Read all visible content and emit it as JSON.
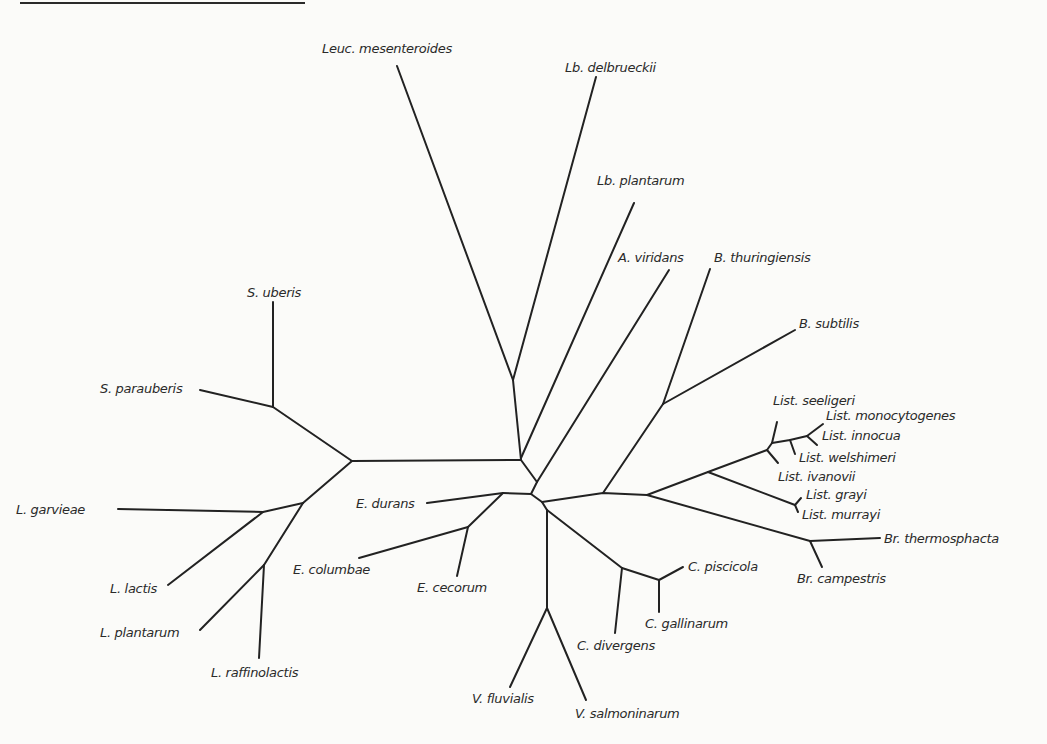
{
  "figure": {
    "type": "unrooted phylogenetic tree",
    "line_color": "#222222",
    "text_color": "#2a2a2a",
    "background": "#fbfbf9"
  },
  "taxa": [
    {
      "id": "leuc_mesenteroides",
      "label": "Leuc. mesenteroides",
      "x": 322,
      "y": 53,
      "anchor": "start"
    },
    {
      "id": "lb_delbrueckii",
      "label": "Lb. delbrueckii",
      "x": 565,
      "y": 72,
      "anchor": "start"
    },
    {
      "id": "lb_plantarum",
      "label": "Lb. plantarum",
      "x": 597,
      "y": 185,
      "anchor": "start"
    },
    {
      "id": "a_viridans",
      "label": "A. viridans",
      "x": 618,
      "y": 262,
      "anchor": "start"
    },
    {
      "id": "b_thuringiensis",
      "label": "B. thuringiensis",
      "x": 714,
      "y": 262,
      "anchor": "start"
    },
    {
      "id": "b_subtilis",
      "label": "B. subtilis",
      "x": 799,
      "y": 328,
      "anchor": "start"
    },
    {
      "id": "s_uberis",
      "label": "S. uberis",
      "x": 247,
      "y": 297,
      "anchor": "start"
    },
    {
      "id": "s_parauberis",
      "label": "S. parauberis",
      "x": 100,
      "y": 393,
      "anchor": "start"
    },
    {
      "id": "list_seeligeri",
      "label": "List. seeligeri",
      "x": 773,
      "y": 405,
      "anchor": "start"
    },
    {
      "id": "list_monocytogenes",
      "label": "List. monocytogenes",
      "x": 826,
      "y": 420,
      "anchor": "start"
    },
    {
      "id": "list_innocua",
      "label": "List. innocua",
      "x": 822,
      "y": 440,
      "anchor": "start"
    },
    {
      "id": "list_welshimeri",
      "label": "List. welshimeri",
      "x": 799,
      "y": 462,
      "anchor": "start"
    },
    {
      "id": "list_ivanovii",
      "label": "List. ivanovii",
      "x": 778,
      "y": 481,
      "anchor": "start"
    },
    {
      "id": "list_grayi",
      "label": "List. grayi",
      "x": 806,
      "y": 499,
      "anchor": "start"
    },
    {
      "id": "list_murrayi",
      "label": "List. murrayi",
      "x": 802,
      "y": 519,
      "anchor": "start"
    },
    {
      "id": "l_garvieae",
      "label": "L. garvieae",
      "x": 16,
      "y": 514,
      "anchor": "start"
    },
    {
      "id": "e_durans",
      "label": "E. durans",
      "x": 356,
      "y": 508,
      "anchor": "start"
    },
    {
      "id": "br_thermosphacta",
      "label": "Br. thermosphacta",
      "x": 884,
      "y": 543,
      "anchor": "start"
    },
    {
      "id": "l_lactis",
      "label": "L. lactis",
      "x": 110,
      "y": 593,
      "anchor": "start"
    },
    {
      "id": "e_columbae",
      "label": "E. columbae",
      "x": 293,
      "y": 574,
      "anchor": "start"
    },
    {
      "id": "e_cecorum",
      "label": "E. cecorum",
      "x": 417,
      "y": 592,
      "anchor": "start"
    },
    {
      "id": "c_piscicola",
      "label": "C. piscicola",
      "x": 688,
      "y": 571,
      "anchor": "start"
    },
    {
      "id": "br_campestris",
      "label": "Br. campestris",
      "x": 797,
      "y": 583,
      "anchor": "start"
    },
    {
      "id": "l_plantarum",
      "label": "L. plantarum",
      "x": 100,
      "y": 637,
      "anchor": "start"
    },
    {
      "id": "c_gallinarum",
      "label": "C. gallinarum",
      "x": 645,
      "y": 628,
      "anchor": "start"
    },
    {
      "id": "c_divergens",
      "label": "C. divergens",
      "x": 577,
      "y": 650,
      "anchor": "start"
    },
    {
      "id": "l_raffinolactis",
      "label": "L. raffinolactis",
      "x": 211,
      "y": 677,
      "anchor": "start"
    },
    {
      "id": "v_fluvialis",
      "label": "V. fluvialis",
      "x": 472,
      "y": 703,
      "anchor": "start"
    },
    {
      "id": "v_salmoninarum",
      "label": "V. salmoninarum",
      "x": 575,
      "y": 718,
      "anchor": "start"
    }
  ],
  "branches": [
    {
      "id": "leuc",
      "points": "397,66 513,380"
    },
    {
      "id": "lb_delb",
      "points": "596,77 513,380"
    },
    {
      "id": "upper_trunk",
      "points": "513,380 521,460 537,482 531,494"
    },
    {
      "id": "strep_lacto_trunk",
      "points": "521,460 352,461"
    },
    {
      "id": "lb_plant",
      "points": "634,203 521,458"
    },
    {
      "id": "a_viridans",
      "points": "669,270 537,482"
    },
    {
      "id": "strep_node",
      "points": "352,461 273,407"
    },
    {
      "id": "s_uberis",
      "points": "273,302 273,407"
    },
    {
      "id": "s_parauberis",
      "points": "200,390 273,407"
    },
    {
      "id": "lacto_node",
      "points": "352,461 303,503"
    },
    {
      "id": "l_garvieae",
      "points": "118,509 263,512 303,503"
    },
    {
      "id": "l_lactis",
      "points": "263,512 168,585"
    },
    {
      "id": "l_sub",
      "points": "303,503 264,565"
    },
    {
      "id": "l_plantarum",
      "points": "264,565 200,630"
    },
    {
      "id": "l_raffinolactis",
      "points": "264,565 259,658"
    },
    {
      "id": "entero_stem",
      "points": "531,494 503,493"
    },
    {
      "id": "e_durans",
      "points": "503,493 427,503"
    },
    {
      "id": "e_sub",
      "points": "503,493 468,527"
    },
    {
      "id": "e_columbae",
      "points": "468,527 359,558"
    },
    {
      "id": "e_cecorum",
      "points": "468,527 457,576"
    },
    {
      "id": "center_down",
      "points": "531,494 542,502 547,510"
    },
    {
      "id": "v_stem",
      "points": "547,510 547,608"
    },
    {
      "id": "v_fluvialis",
      "points": "547,608 510,687"
    },
    {
      "id": "v_salmoninarum",
      "points": "547,608 586,700"
    },
    {
      "id": "c_stem",
      "points": "547,510 622,568 659,580"
    },
    {
      "id": "c_divergens",
      "points": "622,568 615,633"
    },
    {
      "id": "c_piscicola",
      "points": "659,580 683,567"
    },
    {
      "id": "c_gallinarum",
      "points": "659,580 659,612"
    },
    {
      "id": "right_trunk",
      "points": "542,502 603,493 647,495"
    },
    {
      "id": "bacillus_stem",
      "points": "603,493 663,404"
    },
    {
      "id": "b_thuringiensis",
      "points": "663,404 710,269"
    },
    {
      "id": "b_subtilis",
      "points": "663,404 795,330"
    },
    {
      "id": "list_stem",
      "points": "647,495 708,472 767,450"
    },
    {
      "id": "list_ivanovii",
      "points": "767,450 778,463"
    },
    {
      "id": "list_upper",
      "points": "767,450 772,443"
    },
    {
      "id": "list_seeligeri",
      "points": "772,443 777,422"
    },
    {
      "id": "list_mid",
      "points": "772,443 790,440 807,436"
    },
    {
      "id": "list_welshimeri",
      "points": "790,440 795,454"
    },
    {
      "id": "list_monocytogenes",
      "points": "807,436 823,424"
    },
    {
      "id": "list_innocua",
      "points": "807,436 817,445"
    },
    {
      "id": "list_grayi_murrayi_stem",
      "points": "708,472 795,505"
    },
    {
      "id": "list_grayi",
      "points": "795,505 801,498"
    },
    {
      "id": "list_murrayi",
      "points": "795,505 798,512"
    },
    {
      "id": "br_stem",
      "points": "647,495 810,541"
    },
    {
      "id": "br_thermosphacta",
      "points": "810,541 880,538"
    },
    {
      "id": "br_campestris",
      "points": "810,541 822,567"
    }
  ]
}
